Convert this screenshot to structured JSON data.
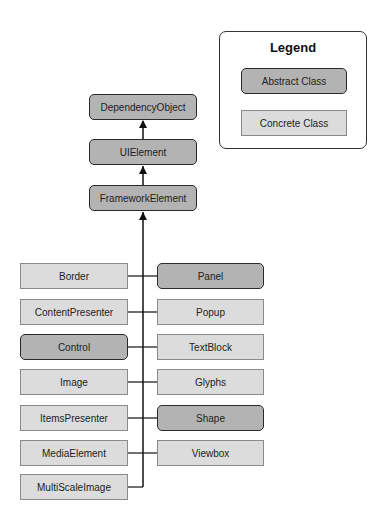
{
  "legend": {
    "title": "Legend",
    "abstract_label": "Abstract Class",
    "concrete_label": "Concrete Class"
  },
  "colors": {
    "abstract_fill": "#b3b3b3",
    "concrete_fill": "#dcdcdc",
    "line": "#111111"
  },
  "hierarchy": {
    "root": "DependencyObject",
    "level2": "UIElement",
    "level3": "FrameworkElement"
  },
  "left_column": [
    {
      "label": "Border",
      "kind": "concrete"
    },
    {
      "label": "ContentPresenter",
      "kind": "concrete"
    },
    {
      "label": "Control",
      "kind": "abstract"
    },
    {
      "label": "Image",
      "kind": "concrete"
    },
    {
      "label": "ItemsPresenter",
      "kind": "concrete"
    },
    {
      "label": "MediaElement",
      "kind": "concrete"
    },
    {
      "label": "MultiScaleImage",
      "kind": "concrete"
    }
  ],
  "right_column": [
    {
      "label": "Panel",
      "kind": "abstract"
    },
    {
      "label": "Popup",
      "kind": "concrete"
    },
    {
      "label": "TextBlock",
      "kind": "concrete"
    },
    {
      "label": "Glyphs",
      "kind": "concrete"
    },
    {
      "label": "Shape",
      "kind": "abstract"
    },
    {
      "label": "Viewbox",
      "kind": "concrete"
    }
  ]
}
